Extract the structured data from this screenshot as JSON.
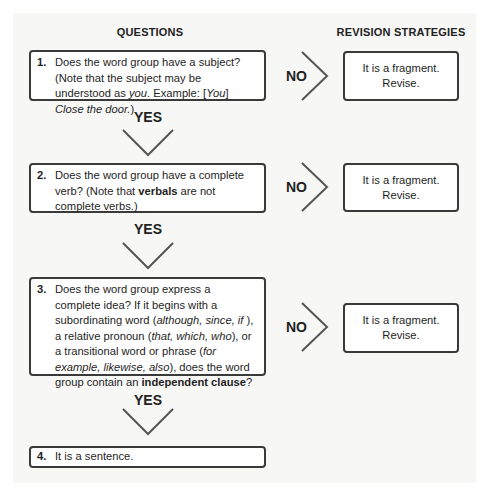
{
  "headers": {
    "questions": "QUESTIONS",
    "revision_strategies": "REVISION STRATEGIES"
  },
  "steps": [
    {
      "number": "1.",
      "segments": [
        {
          "text": "Does the word group have a subject? (Note that the subject may be understood as ",
          "style": "normal"
        },
        {
          "text": "you",
          "style": "italic"
        },
        {
          "text": ". Example: [",
          "style": "normal"
        },
        {
          "text": "You",
          "style": "italic"
        },
        {
          "text": "] ",
          "style": "normal"
        },
        {
          "text": "Close the door.",
          "style": "italic"
        },
        {
          "text": ")",
          "style": "normal"
        }
      ],
      "no_label": "NO",
      "revision": {
        "line1": "It is a fragment.",
        "line2": "Revise."
      },
      "yes_label": "YES"
    },
    {
      "number": "2.",
      "segments": [
        {
          "text": "Does the word group have a complete verb? (Note that ",
          "style": "normal"
        },
        {
          "text": "verbals",
          "style": "bold"
        },
        {
          "text": " are not complete verbs.)",
          "style": "normal"
        }
      ],
      "no_label": "NO",
      "revision": {
        "line1": "It is a fragment.",
        "line2": "Revise."
      },
      "yes_label": "YES"
    },
    {
      "number": "3.",
      "segments": [
        {
          "text": "Does the word group express a complete idea? If it begins with a subordinating word (",
          "style": "normal"
        },
        {
          "text": "although, since, if",
          "style": "italic"
        },
        {
          "text": " ), a relative pronoun (",
          "style": "normal"
        },
        {
          "text": "that, which, who",
          "style": "italic"
        },
        {
          "text": "), or a transitional word or phrase (",
          "style": "normal"
        },
        {
          "text": "for example, likewise, also",
          "style": "italic"
        },
        {
          "text": "), does the word group contain an ",
          "style": "normal"
        },
        {
          "text": "independent clause",
          "style": "bold"
        },
        {
          "text": "?",
          "style": "normal"
        }
      ],
      "no_label": "NO",
      "revision": {
        "line1": "It is a fragment.",
        "line2": "Revise."
      },
      "yes_label": "YES"
    },
    {
      "number": "4.",
      "segments": [
        {
          "text": "It is a sentence.",
          "style": "normal"
        }
      ]
    }
  ],
  "colors": {
    "panel_background": "#f7f7f6",
    "box_border": "#3a3a3a",
    "text": "#1e1e1e",
    "arrow": "#555555"
  }
}
